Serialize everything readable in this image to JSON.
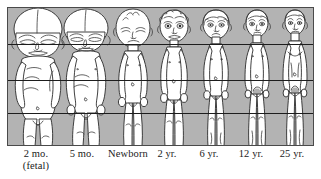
{
  "figure": {
    "panel": {
      "background_color": "#b3b3b3",
      "border_color": "#4a4a4a",
      "x": 7,
      "y": 7,
      "width": 307,
      "height": 139
    },
    "reference_lines": {
      "color": "#1d1d1d",
      "count": 3,
      "labels": [
        "eye-line / chin level",
        "nipple-waist level",
        "pubis / crotch level"
      ],
      "y_positions": [
        44,
        80,
        113
      ]
    },
    "stages": [
      {
        "id": "fetal-2-months",
        "label": "2 mo.",
        "sublabel": "(fetal)",
        "label_center_x": 36,
        "head_fraction": 0.5,
        "figure_left": 9,
        "figure_width": 57,
        "body_top": 8,
        "body_bottom": 146,
        "skin_color": "#ffffff",
        "outline_color": "#2b2b2b"
      },
      {
        "id": "fetal-5-months",
        "label": "5 mo.",
        "sublabel": "",
        "label_center_x": 81,
        "head_fraction": 0.33,
        "figure_left": 58,
        "figure_width": 52,
        "body_top": 8,
        "body_bottom": 146,
        "skin_color": "#ffffff",
        "outline_color": "#2b2b2b"
      },
      {
        "id": "newborn",
        "label": "Newborn",
        "sublabel": "",
        "label_center_x": 128,
        "head_fraction": 0.25,
        "figure_left": 108,
        "figure_width": 45,
        "body_top": 10,
        "body_bottom": 146,
        "skin_color": "#ffffff",
        "outline_color": "#2b2b2b"
      },
      {
        "id": "age-2-years",
        "label": "2 yr.",
        "sublabel": "",
        "label_center_x": 167,
        "head_fraction": 0.2,
        "figure_left": 150,
        "figure_width": 42,
        "body_top": 9,
        "body_bottom": 146,
        "skin_color": "#ffffff",
        "outline_color": "#2b2b2b"
      },
      {
        "id": "age-6-years",
        "label": "6 yr.",
        "sublabel": "",
        "label_center_x": 209,
        "head_fraction": 0.166,
        "figure_left": 192,
        "figure_width": 42,
        "body_top": 9,
        "body_bottom": 146,
        "skin_color": "#ffffff",
        "outline_color": "#2b2b2b"
      },
      {
        "id": "age-12-years",
        "label": "12 yr.",
        "sublabel": "",
        "label_center_x": 251,
        "head_fraction": 0.143,
        "figure_left": 234,
        "figure_width": 40,
        "body_top": 9,
        "body_bottom": 146,
        "skin_color": "#ffffff",
        "outline_color": "#2b2b2b"
      },
      {
        "id": "age-25-years",
        "label": "25 yr.",
        "sublabel": "",
        "label_center_x": 291,
        "head_fraction": 0.125,
        "figure_left": 274,
        "figure_width": 38,
        "body_top": 9,
        "body_bottom": 146,
        "skin_color": "#ffffff",
        "outline_color": "#2b2b2b"
      }
    ]
  }
}
